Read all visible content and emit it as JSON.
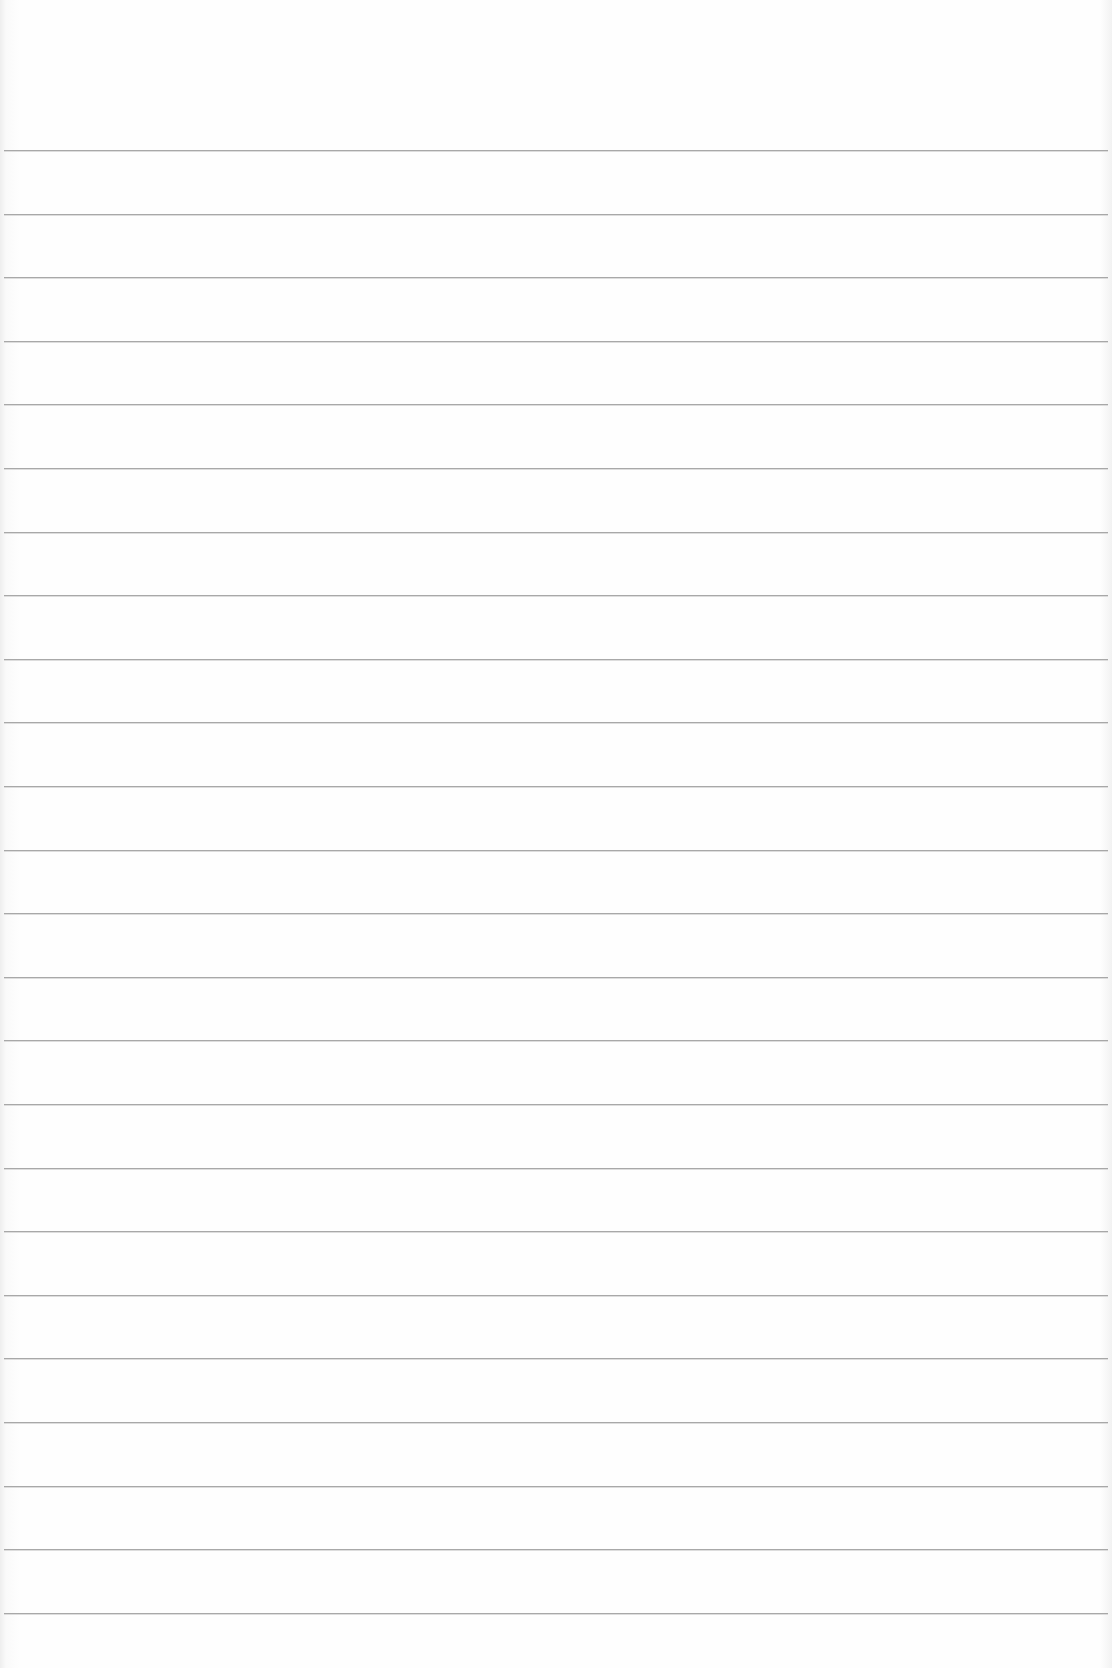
{
  "page": {
    "type": "blank lined paper",
    "background_color": "#fdfdfd",
    "rule_color": "#9a9a9a",
    "text": ""
  },
  "rules": {
    "count": 24,
    "first_y": 150,
    "spacing": 63.6
  }
}
